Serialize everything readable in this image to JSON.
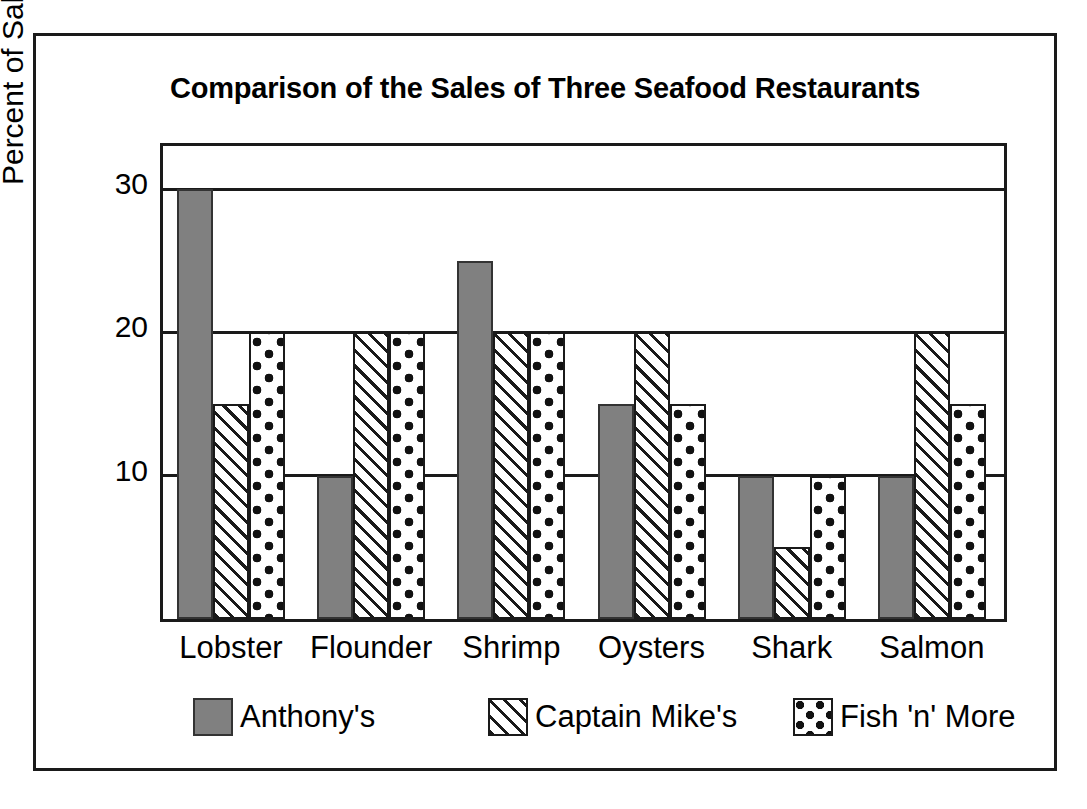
{
  "chart_data": {
    "type": "bar",
    "title": "Comparison of the Sales of Three Seafood Restaurants",
    "xlabel": "",
    "ylabel": "Percent of Sales",
    "categories": [
      "Lobster",
      "Flounder",
      "Shrimp",
      "Oysters",
      "Shark",
      "Salmon"
    ],
    "series": [
      {
        "name": "Anthony's",
        "pattern": "solid",
        "values": [
          30,
          10,
          25,
          15,
          10,
          10
        ]
      },
      {
        "name": "Captain Mike's",
        "pattern": "hatch",
        "values": [
          15,
          20,
          20,
          20,
          5,
          20
        ]
      },
      {
        "name": "Fish 'n' More",
        "pattern": "dots",
        "values": [
          20,
          20,
          20,
          15,
          10,
          15
        ]
      }
    ],
    "ylim": [
      0,
      33
    ],
    "yticks": [
      10,
      20,
      30
    ],
    "ytick_labels": [
      "10",
      "20",
      "30"
    ],
    "grid": true,
    "legend_position": "bottom"
  },
  "colors": {
    "anthonys_fill": "#808080",
    "frame": "#1a1a1a",
    "background": "#ffffff",
    "ink": "#000000"
  }
}
